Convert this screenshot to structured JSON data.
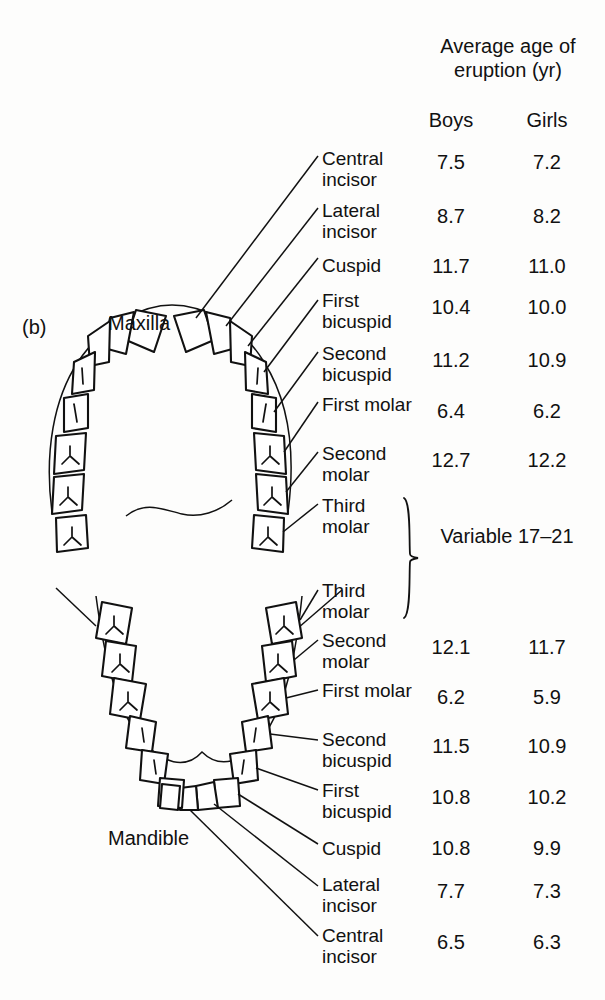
{
  "figure": {
    "letter": "(b)",
    "maxilla_label": "Maxilla",
    "mandible_label": "Mandible"
  },
  "header": {
    "title": "Average age of eruption (yr)",
    "boys": "Boys",
    "girls": "Girls"
  },
  "variable_group": {
    "note": "Variable 17–21",
    "applies_to": [
      "Third molar (maxilla)",
      "Third molar (mandible)"
    ]
  },
  "chart_data": {
    "type": "table",
    "title": "Average age of eruption (yr)",
    "columns": [
      "Tooth",
      "Boys",
      "Girls"
    ],
    "groups": [
      {
        "arch": "Maxilla",
        "rows": [
          {
            "tooth": "Central incisor",
            "boys": "7.5",
            "girls": "7.2"
          },
          {
            "tooth": "Lateral incisor",
            "boys": "8.7",
            "girls": "8.2"
          },
          {
            "tooth": "Cuspid",
            "boys": "11.7",
            "girls": "11.0"
          },
          {
            "tooth": "First bicuspid",
            "boys": "10.4",
            "girls": "10.0"
          },
          {
            "tooth": "Second bicuspid",
            "boys": "11.2",
            "girls": "10.9"
          },
          {
            "tooth": "First molar",
            "boys": "6.4",
            "girls": "6.2"
          },
          {
            "tooth": "Second molar",
            "boys": "12.7",
            "girls": "12.2"
          },
          {
            "tooth": "Third molar",
            "boys": "Variable 17–21",
            "girls": "Variable 17–21"
          }
        ]
      },
      {
        "arch": "Mandible",
        "rows": [
          {
            "tooth": "Third molar",
            "boys": "Variable 17–21",
            "girls": "Variable 17–21"
          },
          {
            "tooth": "Second molar",
            "boys": "12.1",
            "girls": "11.7"
          },
          {
            "tooth": "First molar",
            "boys": "6.2",
            "girls": "5.9"
          },
          {
            "tooth": "Second bicuspid",
            "boys": "11.5",
            "girls": "10.9"
          },
          {
            "tooth": "First bicuspid",
            "boys": "10.8",
            "girls": "10.2"
          },
          {
            "tooth": "Cuspid",
            "boys": "10.8",
            "girls": "9.9"
          },
          {
            "tooth": "Lateral incisor",
            "boys": "7.7",
            "girls": "7.3"
          },
          {
            "tooth": "Central incisor",
            "boys": "6.5",
            "girls": "6.3"
          }
        ]
      }
    ]
  },
  "rows": [
    {
      "label": "Central\nincisor",
      "boys": "7.5",
      "girls": "7.2",
      "y": 148,
      "vy": 152
    },
    {
      "label": "Lateral\nincisor",
      "boys": "8.7",
      "girls": "8.2",
      "y": 200,
      "vy": 206
    },
    {
      "label": "Cuspid",
      "boys": "11.7",
      "girls": "11.0",
      "y": 255,
      "vy": 256
    },
    {
      "label": "First\nbicuspid",
      "boys": "10.4",
      "girls": "10.0",
      "y": 290,
      "vy": 297
    },
    {
      "label": "Second\nbicuspid",
      "boys": "11.2",
      "girls": "10.9",
      "y": 343,
      "vy": 350
    },
    {
      "label": "First\nmolar",
      "boys": "6.4",
      "girls": "6.2",
      "y": 394,
      "vy": 401
    },
    {
      "label": "Second\nmolar",
      "boys": "12.7",
      "girls": "12.2",
      "y": 443,
      "vy": 450
    },
    {
      "label": "Third\nmolar",
      "boys": "",
      "girls": "",
      "y": 495,
      "vy": 0
    },
    {
      "label": "Third\nmolar",
      "boys": "",
      "girls": "",
      "y": 580,
      "vy": 0
    },
    {
      "label": "Second\nmolar",
      "boys": "12.1",
      "girls": "11.7",
      "y": 630,
      "vy": 637
    },
    {
      "label": "First\nmolar",
      "boys": "6.2",
      "girls": "5.9",
      "y": 680,
      "vy": 687
    },
    {
      "label": "Second\nbicuspid",
      "boys": "11.5",
      "girls": "10.9",
      "y": 729,
      "vy": 736
    },
    {
      "label": "First\nbicuspid",
      "boys": "10.8",
      "girls": "10.2",
      "y": 780,
      "vy": 787
    },
    {
      "label": "Cuspid",
      "boys": "10.8",
      "girls": "9.9",
      "y": 838,
      "vy": 838
    },
    {
      "label": "Lateral\nincisor",
      "boys": "7.7",
      "girls": "7.3",
      "y": 874,
      "vy": 881
    },
    {
      "label": "Central\nincisor",
      "boys": "6.5",
      "girls": "6.3",
      "y": 925,
      "vy": 932
    }
  ]
}
